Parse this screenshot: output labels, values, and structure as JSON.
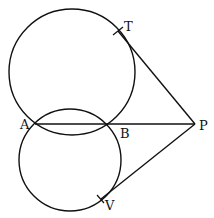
{
  "figure": {
    "type": "geometry",
    "points": {
      "A": {
        "label": "A",
        "x": 35,
        "y": 124
      },
      "B": {
        "label": "B",
        "x": 107,
        "y": 124
      },
      "P": {
        "label": "P",
        "x": 195,
        "y": 124
      },
      "T": {
        "label": "T",
        "x": 118,
        "y": 31
      },
      "V": {
        "label": "V",
        "x": 101,
        "y": 199
      }
    },
    "circles": [
      {
        "name": "upper-circle",
        "cx": 72,
        "cy": 72,
        "r": 63
      },
      {
        "name": "lower-circle",
        "cx": 70,
        "cy": 160,
        "r": 51
      }
    ],
    "segments": [
      {
        "name": "line-APB",
        "from": "A",
        "to": "P"
      },
      {
        "name": "tangent-PT",
        "from": "P",
        "to": "T"
      },
      {
        "name": "tangent-PV",
        "from": "P",
        "to": "V"
      }
    ],
    "colors": {
      "stroke": "#111111",
      "background": "#ffffff"
    }
  }
}
